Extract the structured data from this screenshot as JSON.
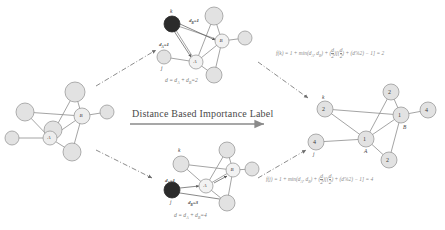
{
  "figure": {
    "arrow_label": "Distance Based Importance Label",
    "colors": {
      "node_fill": "#e2e2e2",
      "node_stroke": "#9a9a9a",
      "highlight_fill": "#2b2b2b",
      "edge": "#8d8d8d",
      "text": "#3a3a3a",
      "equation_text": "#8a8a8a",
      "connector": "#6e6e6e"
    }
  },
  "source_graph": {
    "name": "input-graph",
    "nodes": [
      {
        "id": "n1",
        "label": "",
        "cx": 53,
        "cy": 130,
        "r": 9
      },
      {
        "id": "n2",
        "label": "",
        "cx": 25,
        "cy": 112,
        "r": 9
      },
      {
        "id": "n3",
        "label": "",
        "cx": 12,
        "cy": 138,
        "r": 7
      },
      {
        "id": "A",
        "label": "A",
        "cx": 50,
        "cy": 138,
        "r": 7
      },
      {
        "id": "B",
        "label": "B",
        "cx": 82,
        "cy": 116,
        "r": 8
      },
      {
        "id": "n4",
        "label": "",
        "cx": 75,
        "cy": 92,
        "r": 10
      },
      {
        "id": "n5",
        "label": "",
        "cx": 107,
        "cy": 112,
        "r": 7
      },
      {
        "id": "n6",
        "label": "",
        "cx": 72,
        "cy": 152,
        "r": 9
      }
    ]
  },
  "top_detail": {
    "name": "k-distance-graph",
    "focus_node": "k",
    "distance_a": "d",
    "distance_a_sub": "A",
    "distance_a_value": "=1",
    "distance_b": "d",
    "distance_b_sub": "B",
    "distance_b_value": "=1",
    "k_letter": "k",
    "j_letter": "j",
    "a_letter": "A",
    "b_letter": "B",
    "equation": "d = d",
    "equation_sub1": "A",
    "equation_mid": " + d",
    "equation_sub2": "B",
    "equation_end": "=2",
    "nodes": [
      {
        "id": "k",
        "label": "",
        "cx": 172,
        "cy": 24,
        "r": 8,
        "highlight": true
      },
      {
        "id": "j",
        "label": "",
        "cx": 164,
        "cy": 57,
        "r": 7,
        "highlight": false
      },
      {
        "id": "A",
        "label": "A",
        "cx": 196,
        "cy": 62,
        "r": 7,
        "highlight": false
      },
      {
        "id": "B",
        "label": "B",
        "cx": 222,
        "cy": 41,
        "r": 7,
        "highlight": false
      },
      {
        "id": "t1",
        "label": "",
        "cx": 214,
        "cy": 16,
        "r": 9,
        "highlight": false
      },
      {
        "id": "t2",
        "label": "",
        "cx": 245,
        "cy": 38,
        "r": 7,
        "highlight": false
      },
      {
        "id": "t3",
        "label": "",
        "cx": 214,
        "cy": 75,
        "r": 8,
        "highlight": false
      }
    ]
  },
  "bottom_detail": {
    "name": "j-distance-graph",
    "focus_node": "j",
    "distance_a": "d",
    "distance_a_sub": "A",
    "distance_a_value": "=1",
    "distance_b": "d",
    "distance_b_sub": "B",
    "distance_b_value": "=3",
    "k_letter": "k",
    "j_letter": "j",
    "a_letter": "A",
    "b_letter": "B",
    "equation": "d = d",
    "equation_sub1": "A",
    "equation_mid": " + d",
    "equation_sub2": "B",
    "equation_end": "=4",
    "nodes": [
      {
        "id": "j",
        "label": "",
        "cx": 172,
        "cy": 190,
        "r": 8,
        "highlight": true
      },
      {
        "id": "k",
        "label": "",
        "cx": 181,
        "cy": 164,
        "r": 8,
        "highlight": false
      },
      {
        "id": "A",
        "label": "A",
        "cx": 206,
        "cy": 186,
        "r": 7,
        "highlight": false
      },
      {
        "id": "B",
        "label": "B",
        "cx": 233,
        "cy": 170,
        "r": 7,
        "highlight": false
      },
      {
        "id": "t1",
        "label": "",
        "cx": 227,
        "cy": 150,
        "r": 8,
        "highlight": false
      },
      {
        "id": "t2",
        "label": "",
        "cx": 252,
        "cy": 169,
        "r": 7,
        "highlight": false
      },
      {
        "id": "t3",
        "label": "",
        "cx": 227,
        "cy": 203,
        "r": 8,
        "highlight": false
      }
    ]
  },
  "formulas": {
    "top": {
      "name": "f-of-k",
      "lhs": "f(k) = 1 + min(d",
      "sub_a": "A",
      "mid": ", d",
      "sub_b": "B",
      "after": ") + ",
      "frac_num": "d",
      "frac_den": "2",
      "bracket_open": "[",
      "frac2_num": "d",
      "frac2_den": "2",
      "plus": " + (d%2) − 1",
      "bracket_close": "]",
      "result": " = 2"
    },
    "bottom": {
      "name": "f-of-j",
      "lhs": "f(j) = 1 + min(d",
      "sub_a": "A",
      "mid": ", d",
      "sub_b": "B",
      "after": ") + ",
      "frac_num": "d",
      "frac_den": "2",
      "bracket_open": "[",
      "frac2_num": "d",
      "frac2_den": "2",
      "plus": " + (d%2) − 1",
      "bracket_close": "]",
      "result": " = 4"
    }
  },
  "result_graph": {
    "name": "labeled-output-graph",
    "k_letter": "k",
    "j_letter": "j",
    "a_letter": "A",
    "b_letter": "B",
    "nodes": [
      {
        "id": "k",
        "label": "2",
        "cx": 325,
        "cy": 109,
        "r": 8
      },
      {
        "id": "j",
        "label": "4",
        "cx": 316,
        "cy": 142,
        "r": 8
      },
      {
        "id": "A",
        "label": "1",
        "cx": 366,
        "cy": 139,
        "r": 8
      },
      {
        "id": "B",
        "label": "1",
        "cx": 401,
        "cy": 115,
        "r": 8
      },
      {
        "id": "t1",
        "label": "2",
        "cx": 391,
        "cy": 92,
        "r": 8
      },
      {
        "id": "t2",
        "label": "4",
        "cx": 428,
        "cy": 110,
        "r": 8
      },
      {
        "id": "t3",
        "label": "2",
        "cx": 389,
        "cy": 160,
        "r": 8
      }
    ]
  }
}
